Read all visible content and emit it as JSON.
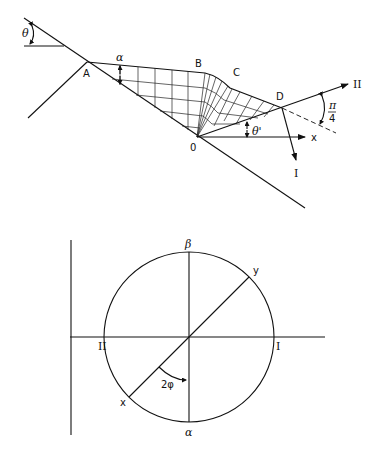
{
  "top_figure": {
    "labels": {
      "theta": "θ",
      "alpha": "α",
      "A": "A",
      "B": "B",
      "C": "C",
      "D": "D",
      "O": "0",
      "theta_prime": "θ'",
      "x": "x",
      "I": "I",
      "II": "II",
      "pi": "π",
      "four": "4"
    }
  },
  "bottom_figure": {
    "labels": {
      "beta": "β",
      "alpha": "α",
      "I": "I",
      "II": "II",
      "x": "x",
      "y": "y",
      "two_phi": "2φ"
    }
  }
}
